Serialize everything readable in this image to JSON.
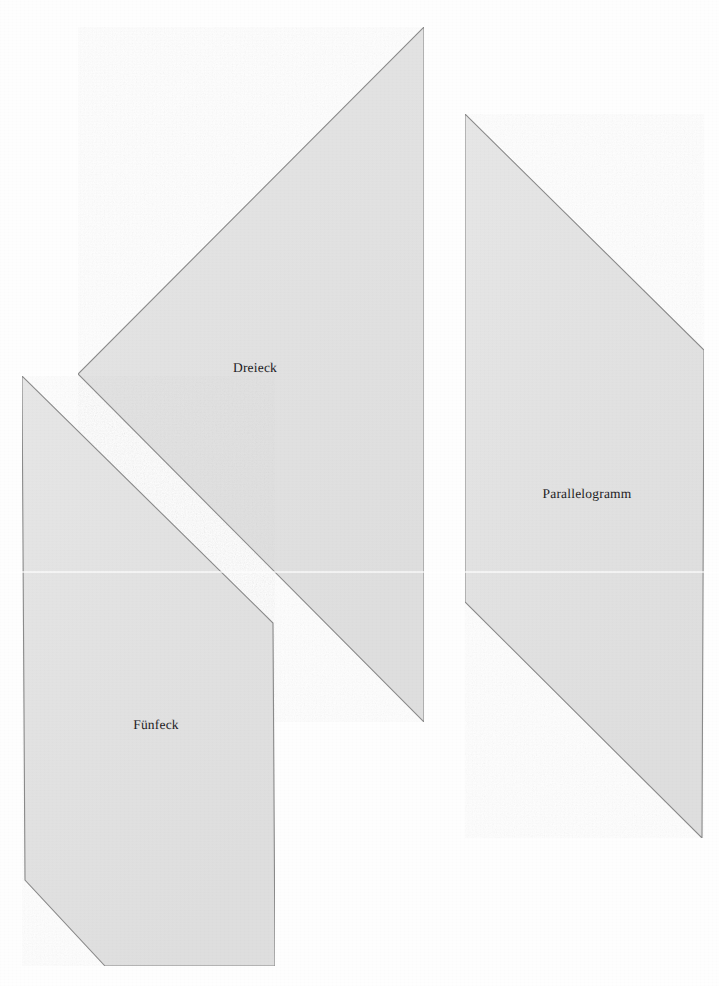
{
  "page": {
    "width": 719,
    "height": 986,
    "background_color": "#fefefe",
    "scan_seam_y": 571,
    "document_type": "scanned-worksheet-geometric-shapes"
  },
  "style": {
    "shape_fill": "#e3e3e3",
    "shape_fill_alt": "#e0e0e0",
    "shape_stroke": "#8f8f8f",
    "shape_stroke_dark": "#6a6a6a",
    "label_color": "#23211f",
    "label_font_size": "13.5px"
  },
  "figures": [
    {
      "id": "triangle",
      "name": "Dreieck",
      "label": "Dreieck",
      "sides": 3,
      "label_x": 255,
      "label_y": 368,
      "points": "424,27 78,374 424,722",
      "vertices": [
        {
          "x": 424,
          "y": 27
        },
        {
          "x": 78,
          "y": 374
        },
        {
          "x": 424,
          "y": 722
        }
      ]
    },
    {
      "id": "parallelogram",
      "name": "Parallelogramm",
      "label": "Parallelogramm",
      "sides": 4,
      "label_x": 587,
      "label_y": 494,
      "points": "465,114 704,350 702,838 465,602",
      "vertices": [
        {
          "x": 465,
          "y": 114
        },
        {
          "x": 704,
          "y": 350
        },
        {
          "x": 702,
          "y": 838
        },
        {
          "x": 465,
          "y": 602
        }
      ]
    },
    {
      "id": "pentagon",
      "name": "Fünfeck",
      "label": "Fünfeck",
      "sides": 5,
      "label_x": 156,
      "label_y": 725,
      "points": "22,376 273,623 275,966 105,966 25,880",
      "vertices": [
        {
          "x": 22,
          "y": 376
        },
        {
          "x": 273,
          "y": 623
        },
        {
          "x": 275,
          "y": 966
        },
        {
          "x": 105,
          "y": 966
        },
        {
          "x": 25,
          "y": 880
        }
      ]
    }
  ]
}
